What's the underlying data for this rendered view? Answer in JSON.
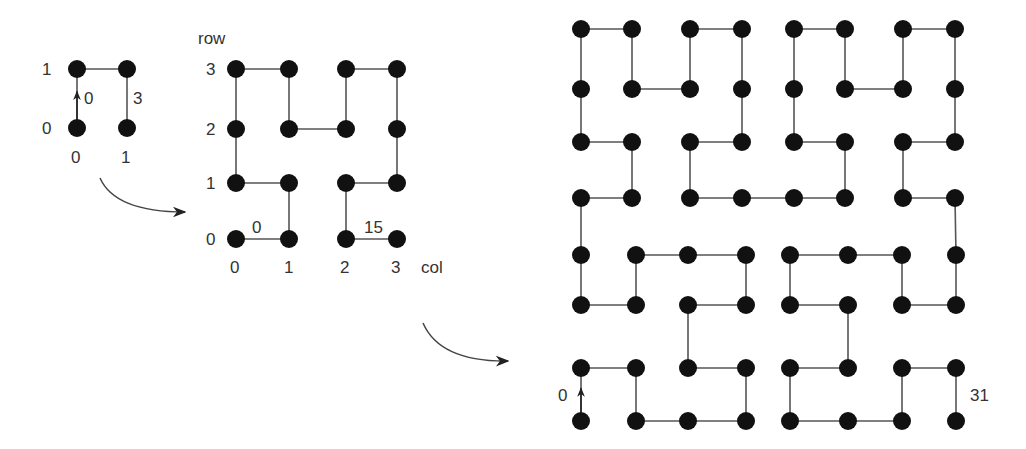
{
  "colors": {
    "dot": "#111111",
    "line": "#555555",
    "text": "#333333",
    "background": "#ffffff"
  },
  "order1": {
    "n": 2,
    "dot_radius": 9,
    "x": [
      77,
      127
    ],
    "y": [
      128,
      69
    ],
    "row_labels": [
      "0",
      "1"
    ],
    "col_labels": [
      "0",
      "1"
    ],
    "start_index_label": "0",
    "end_index_label": "3"
  },
  "order2": {
    "n": 4,
    "dot_radius": 9,
    "x": [
      236,
      289,
      346,
      397
    ],
    "y": [
      239,
      183,
      129,
      69
    ],
    "axis_row_label": "row",
    "axis_col_label": "col",
    "row_labels": [
      "0",
      "1",
      "2",
      "3"
    ],
    "col_labels": [
      "0",
      "1",
      "2",
      "3"
    ],
    "start_index_label": "0",
    "end_index_label": "15"
  },
  "order3": {
    "n": 8,
    "dot_radius": 9,
    "x_top": [
      581,
      632,
      690,
      742,
      794,
      845,
      903,
      955
    ],
    "x_bottom": [
      581,
      636,
      688,
      746,
      790,
      848,
      902,
      956
    ],
    "y": [
      421,
      368,
      305,
      255,
      198,
      142,
      89,
      29
    ],
    "start_index_label": "0",
    "end_index_label": "31"
  },
  "arrows": [
    {
      "from": [
        100,
        178
      ],
      "ctrl": [
        115,
        212
      ],
      "to": [
        185,
        212
      ]
    },
    {
      "from": [
        423,
        323
      ],
      "ctrl": [
        440,
        362
      ],
      "to": [
        508,
        361
      ]
    }
  ]
}
